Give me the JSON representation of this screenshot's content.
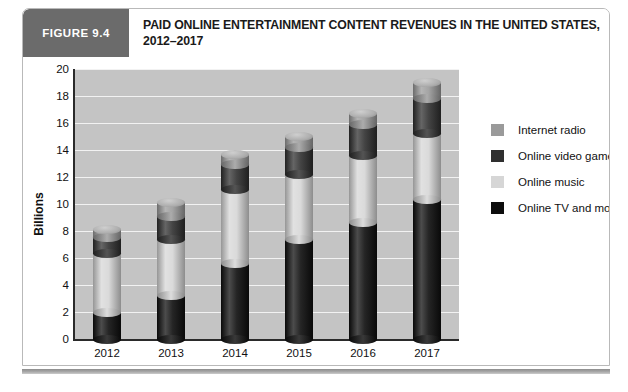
{
  "figure": {
    "badge": "FIGURE 9.4",
    "title_line1": "PAID ONLINE ENTERTAINMENT CONTENT REVENUES IN THE UNITED STATES,",
    "title_line2": "2012–2017"
  },
  "colors": {
    "badge_bg": "#6b6b6b",
    "plot_bg": "#c4c4c4",
    "gridline": "#f2f2f2",
    "axis": "#2a2a2a",
    "internet_radio": "#9a9a9a",
    "online_video_games": "#2f2f2f",
    "online_music": "#d6d6d6",
    "online_tv_and_movies": "#0d0d0d"
  },
  "legend": {
    "position": "right",
    "items": [
      {
        "label": "Internet radio",
        "color": "#9a9a9a"
      },
      {
        "label": "Online video games",
        "color": "#2f2f2f"
      },
      {
        "label": "Online music",
        "color": "#d6d6d6"
      },
      {
        "label": "Online TV and movies",
        "color": "#0d0d0d"
      }
    ]
  },
  "chart_data": {
    "type": "bar",
    "subtype": "stacked-cylinder-3d",
    "title": "PAID ONLINE ENTERTAINMENT CONTENT REVENUES IN THE UNITED STATES, 2012–2017",
    "xlabel": "",
    "ylabel": "Billions",
    "categories": [
      "2012",
      "2013",
      "2014",
      "2015",
      "2016",
      "2017"
    ],
    "ylim": [
      0,
      20
    ],
    "yticks": [
      0,
      2,
      4,
      6,
      8,
      10,
      12,
      14,
      16,
      18,
      20
    ],
    "ytick_labels": [
      "0",
      "2",
      "4",
      "6",
      "8",
      "10",
      "12",
      "14",
      "16",
      "18",
      "20"
    ],
    "grid": true,
    "stack_order_bottom_to_top": [
      "Online TV and movies",
      "Online music",
      "Online video games",
      "Internet radio"
    ],
    "series": [
      {
        "name": "Online TV and movies",
        "color": "#0d0d0d",
        "values": [
          2.0,
          3.2,
          5.6,
          7.4,
          8.6,
          10.3
        ]
      },
      {
        "name": "Online music",
        "color": "#d6d6d6",
        "values": [
          4.3,
          4.2,
          5.5,
          4.8,
          5.0,
          4.9
        ]
      },
      {
        "name": "Online video games",
        "color": "#2f2f2f",
        "values": [
          1.2,
          1.7,
          1.8,
          2.0,
          2.3,
          2.6
        ]
      },
      {
        "name": "Internet radio",
        "color": "#9a9a9a",
        "values": [
          0.6,
          1.0,
          0.8,
          0.8,
          0.8,
          1.2
        ]
      }
    ],
    "totals": [
      8.1,
      10.1,
      13.7,
      15.0,
      16.7,
      19.0
    ]
  }
}
